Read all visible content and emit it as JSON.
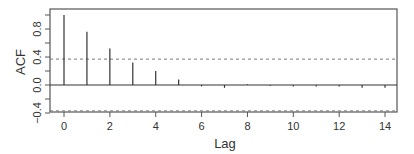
{
  "chart_data": {
    "type": "bar",
    "subtype": "acf-stem",
    "title": "",
    "xlabel": "Lag",
    "ylabel": "ACF",
    "x": [
      0,
      1,
      2,
      3,
      4,
      5,
      6,
      7,
      8,
      9,
      10,
      11,
      12,
      13,
      14
    ],
    "values": [
      1.0,
      0.76,
      0.52,
      0.32,
      0.2,
      0.08,
      -0.02,
      -0.04,
      0.01,
      -0.01,
      -0.02,
      -0.02,
      -0.02,
      -0.04,
      -0.04
    ],
    "confidence_band": {
      "upper": 0.37,
      "lower": -0.37,
      "style": "dashed"
    },
    "xlim": [
      -0.5,
      14.5
    ],
    "ylim": [
      -0.4,
      1.09
    ],
    "x_ticks": [
      0,
      2,
      4,
      6,
      8,
      10,
      12,
      14
    ],
    "x_tick_labels": [
      "0",
      "2",
      "4",
      "6",
      "8",
      "10",
      "12",
      "14"
    ],
    "y_ticks": [
      -0.4,
      -0.2,
      0.0,
      0.2,
      0.4,
      0.6,
      0.8,
      1.0
    ],
    "y_tick_labels": [
      {
        "value": -0.4,
        "label": "−0.4"
      },
      {
        "value": 0.0,
        "label": "0.0"
      },
      {
        "value": 0.4,
        "label": "0.4"
      },
      {
        "value": 0.8,
        "label": "0.8"
      }
    ],
    "grid": false,
    "legend": null,
    "colors": {
      "spikes": "#333333",
      "frame": "#555555",
      "band": "#777777"
    }
  }
}
